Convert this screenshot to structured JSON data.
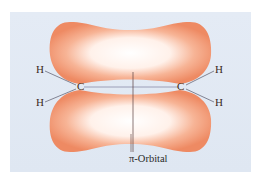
{
  "diagram": {
    "panel_color": "#dde6f2",
    "lobe_color": "#f2906a",
    "lobe_highlight": "#ffffff",
    "atoms": {
      "h_top_left": "H",
      "h_bottom_left": "H",
      "c_left": "C",
      "c_right": "C",
      "h_top_right": "H",
      "h_bottom_right": "H"
    },
    "caption": "π-Orbital"
  }
}
